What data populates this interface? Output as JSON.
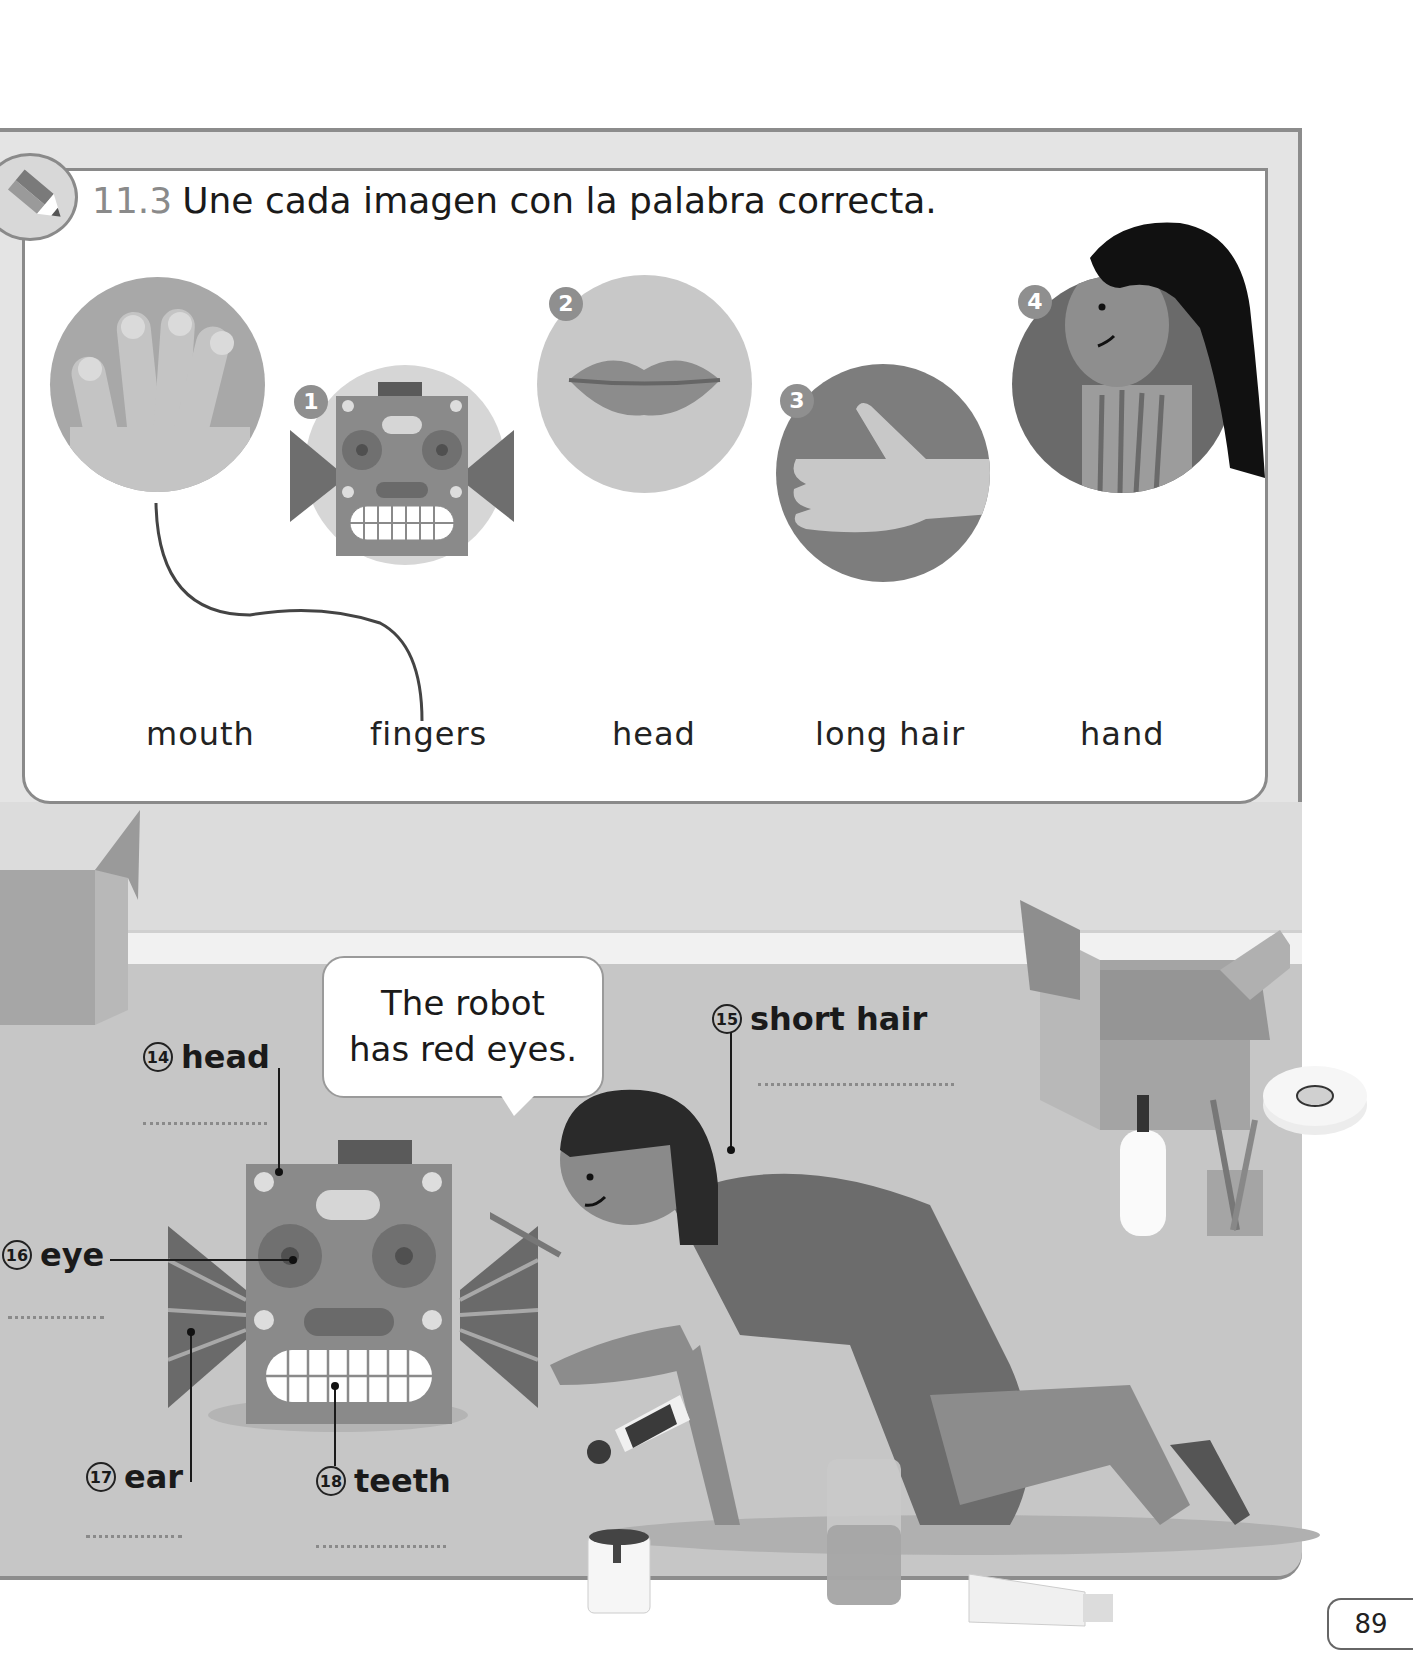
{
  "exercise": {
    "number": "11.3",
    "instruction": "Une cada imagen con la palabra correcta.",
    "icon": "pencil-icon",
    "pictures": [
      {
        "badge": "",
        "depicts": "fingers"
      },
      {
        "badge": "1",
        "depicts": "robot head"
      },
      {
        "badge": "2",
        "depicts": "mouth"
      },
      {
        "badge": "3",
        "depicts": "hand"
      },
      {
        "badge": "4",
        "depicts": "long hair"
      }
    ],
    "words": [
      "mouth",
      "fingers",
      "head",
      "long hair",
      "hand"
    ],
    "example_match": {
      "from_picture": "fingers-circle",
      "to_word": "fingers"
    }
  },
  "scene": {
    "speech_bubble": {
      "line1": "The robot",
      "line2": "has red eyes."
    },
    "labels": [
      {
        "num": "14",
        "text": "head"
      },
      {
        "num": "15",
        "text": "short hair"
      },
      {
        "num": "16",
        "text": "eye"
      },
      {
        "num": "17",
        "text": "ear"
      },
      {
        "num": "18",
        "text": "teeth"
      }
    ]
  },
  "page_number": "89",
  "colors": {
    "frame": "#8c8c8c",
    "background": "#e4e4e4",
    "floor": "#c6c6c6",
    "badge": "#8f8f8f",
    "ink": "#1a1a1a"
  }
}
